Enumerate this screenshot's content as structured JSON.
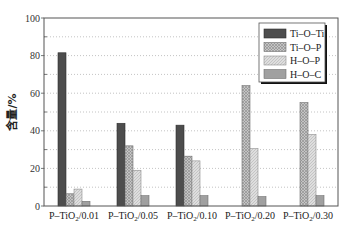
{
  "chart_data": {
    "type": "bar",
    "title": "",
    "xlabel": "",
    "ylabel": "含量/%",
    "ylim": [
      0,
      100
    ],
    "yticks": [
      0,
      20,
      40,
      60,
      80,
      100
    ],
    "grid": "horizontal dotted (minor every 10)",
    "legend_position": "upper right",
    "categories": [
      "P-TiO₂/0.01",
      "P-TiO₂/0.05",
      "P-TiO₂/0.10",
      "P-TiO₂/0.20",
      "P-TiO₂/0.30"
    ],
    "series": [
      {
        "name": "Ti-O-Ti",
        "values": [
          81.5,
          44,
          43,
          0,
          0
        ],
        "color": "#4a4a4a",
        "pattern": "solid-dark"
      },
      {
        "name": "Ti-O-P",
        "values": [
          6.5,
          32,
          26.5,
          64,
          55
        ],
        "color": "#b8b8b8",
        "pattern": "crosshatch"
      },
      {
        "name": "H-O-P",
        "values": [
          9,
          19,
          24,
          30.5,
          38
        ],
        "color": "#d4d4d4",
        "pattern": "light-hatch"
      },
      {
        "name": "H-O-C",
        "values": [
          2.5,
          5.5,
          5.5,
          5,
          5.5
        ],
        "color": "#9a9a9a",
        "pattern": "solid-medium"
      }
    ]
  }
}
